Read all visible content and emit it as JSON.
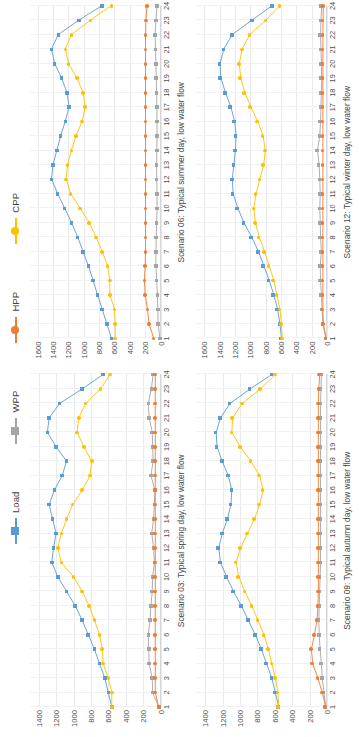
{
  "figure": {
    "legend": [
      {
        "name": "Load",
        "color": "#5b9bd5",
        "marker": "square"
      },
      {
        "name": "WPP",
        "color": "#a5a5a5",
        "marker": "square"
      },
      {
        "name": "HPP",
        "color": "#ed7d31",
        "marker": "circle"
      },
      {
        "name": "CPP",
        "color": "#ffc000",
        "marker": "circle"
      }
    ]
  },
  "chart_data": [
    {
      "type": "line",
      "title": "Scenario 03: Typical spring day, low water flow",
      "xlabel": "",
      "ylabel": "",
      "grid": true,
      "legend_position": "top",
      "x": [
        1,
        2,
        3,
        4,
        5,
        6,
        7,
        8,
        9,
        10,
        11,
        12,
        13,
        14,
        15,
        16,
        17,
        18,
        19,
        20,
        21,
        22,
        23,
        24
      ],
      "xtick_labels": [
        "1",
        "2",
        "3",
        "4",
        "5",
        "6",
        "7",
        "8",
        "9",
        "10",
        "11",
        "12",
        "13",
        "14",
        "15",
        "16",
        "17",
        "18",
        "19",
        "20",
        "21",
        "22",
        "23",
        "24"
      ],
      "ylim": [
        0,
        1500
      ],
      "ytick_labels": [
        "0",
        "200",
        "400",
        "600",
        "800",
        "1000",
        "1200",
        "1400"
      ],
      "yticks": [
        0,
        200,
        400,
        600,
        800,
        1000,
        1200,
        1400
      ],
      "series": [
        {
          "name": "Load",
          "color": "#5b9bd5",
          "values": [
            560,
            600,
            640,
            700,
            760,
            830,
            900,
            980,
            1080,
            1180,
            1250,
            1230,
            1200,
            1240,
            1280,
            1220,
            1130,
            1080,
            1200,
            1300,
            1280,
            1160,
            900,
            660
          ]
        },
        {
          "name": "CPP",
          "color": "#ffc000",
          "values": [
            560,
            560,
            600,
            660,
            670,
            700,
            760,
            820,
            900,
            1000,
            1140,
            1180,
            1140,
            1080,
            1010,
            900,
            810,
            790,
            880,
            960,
            940,
            860,
            690,
            580
          ]
        },
        {
          "name": "WPP",
          "color": "#a5a5a5",
          "values": [
            20,
            90,
            95,
            130,
            135,
            140,
            120,
            110,
            95,
            90,
            70,
            80,
            100,
            80,
            70,
            65,
            110,
            85,
            90,
            95,
            130,
            140,
            105,
            85
          ]
        },
        {
          "name": "HPP",
          "color": "#ed7d31",
          "values": [
            20,
            60,
            60,
            60,
            60,
            60,
            60,
            60,
            60,
            60,
            60,
            60,
            60,
            60,
            60,
            60,
            60,
            60,
            60,
            60,
            60,
            60,
            60,
            60
          ]
        }
      ]
    },
    {
      "type": "line",
      "title": "Scenario 06: Typical summer day, low water flow",
      "xlabel": "",
      "ylabel": "",
      "grid": true,
      "legend_position": "top",
      "x": [
        1,
        2,
        3,
        4,
        5,
        6,
        7,
        8,
        9,
        10,
        11,
        12,
        13,
        14,
        15,
        16,
        17,
        18,
        19,
        20,
        21,
        22,
        23,
        24
      ],
      "xtick_labels": [
        "1",
        "2",
        "3",
        "4",
        "5",
        "6",
        "7",
        "8",
        "9",
        "10",
        "11",
        "12",
        "13",
        "14",
        "15",
        "16",
        "17",
        "18",
        "19",
        "20",
        "21",
        "22",
        "23",
        "24"
      ],
      "ylim": [
        0,
        1700
      ],
      "ytick_labels": [
        "0",
        "200",
        "400",
        "600",
        "800",
        "1000",
        "1200",
        "1400",
        "1600"
      ],
      "yticks": [
        0,
        200,
        400,
        600,
        800,
        1000,
        1200,
        1400,
        1600
      ],
      "series": [
        {
          "name": "Load",
          "color": "#5b9bd5",
          "values": [
            640,
            700,
            760,
            820,
            880,
            940,
            1010,
            1080,
            1160,
            1250,
            1340,
            1420,
            1400,
            1350,
            1300,
            1240,
            1190,
            1220,
            1290,
            1380,
            1420,
            1330,
            1060,
            760
          ]
        },
        {
          "name": "CPP",
          "color": "#ffc000",
          "values": [
            590,
            590,
            600,
            660,
            660,
            690,
            760,
            840,
            930,
            1050,
            1170,
            1230,
            1210,
            1160,
            1100,
            1020,
            980,
            1010,
            1090,
            1200,
            1240,
            1160,
            910,
            640
          ]
        },
        {
          "name": "WPP",
          "color": "#a5a5a5",
          "values": [
            10,
            30,
            35,
            40,
            50,
            60,
            60,
            55,
            50,
            45,
            45,
            50,
            50,
            48,
            45,
            45,
            48,
            50,
            55,
            60,
            65,
            70,
            60,
            45
          ]
        },
        {
          "name": "HPP",
          "color": "#ed7d31",
          "values": [
            90,
            150,
            170,
            200,
            210,
            200,
            195,
            195,
            195,
            195,
            195,
            195,
            195,
            195,
            195,
            195,
            195,
            195,
            195,
            195,
            195,
            195,
            190,
            175
          ]
        }
      ]
    },
    {
      "type": "line",
      "title": "Scenario 09: Typical autumn day, low water flow",
      "xlabel": "",
      "ylabel": "",
      "grid": true,
      "legend_position": "top",
      "x": [
        1,
        2,
        3,
        4,
        5,
        6,
        7,
        8,
        9,
        10,
        11,
        12,
        13,
        14,
        15,
        16,
        17,
        18,
        19,
        20,
        21,
        22,
        23,
        24
      ],
      "xtick_labels": [
        "1",
        "2",
        "3",
        "4",
        "5",
        "6",
        "7",
        "8",
        "9",
        "10",
        "11",
        "12",
        "13",
        "14",
        "15",
        "16",
        "17",
        "18",
        "19",
        "20",
        "21",
        "22",
        "23",
        "24"
      ],
      "ylim": [
        0,
        1500
      ],
      "ytick_labels": [
        "0",
        "200",
        "400",
        "600",
        "800",
        "1000",
        "1200",
        "1400"
      ],
      "yticks": [
        0,
        200,
        400,
        600,
        800,
        1000,
        1200,
        1400
      ],
      "series": [
        {
          "name": "Load",
          "color": "#5b9bd5",
          "values": [
            560,
            600,
            640,
            700,
            760,
            830,
            910,
            990,
            1080,
            1160,
            1230,
            1250,
            1210,
            1150,
            1110,
            1100,
            1140,
            1210,
            1270,
            1280,
            1230,
            1120,
            890,
            640
          ]
        },
        {
          "name": "CPP",
          "color": "#ffc000",
          "values": [
            560,
            570,
            600,
            640,
            680,
            730,
            800,
            870,
            950,
            1020,
            1050,
            1000,
            920,
            840,
            780,
            740,
            780,
            880,
            1000,
            1100,
            1090,
            980,
            770,
            600
          ]
        },
        {
          "name": "WPP",
          "color": "#a5a5a5",
          "values": [
            20,
            40,
            60,
            70,
            85,
            95,
            100,
            95,
            90,
            85,
            80,
            80,
            80,
            80,
            80,
            80,
            80,
            80,
            80,
            80,
            80,
            80,
            75,
            70
          ]
        },
        {
          "name": "HPP",
          "color": "#ed7d31",
          "values": [
            20,
            60,
            110,
            170,
            185,
            150,
            120,
            110,
            105,
            105,
            105,
            105,
            105,
            105,
            105,
            105,
            105,
            105,
            105,
            105,
            105,
            105,
            100,
            90
          ]
        }
      ]
    },
    {
      "type": "line",
      "title": "Scenario 12: Typical winter day, low water flow",
      "xlabel": "",
      "ylabel": "",
      "grid": true,
      "legend_position": "top",
      "x": [
        1,
        2,
        3,
        4,
        5,
        6,
        7,
        8,
        9,
        10,
        11,
        12,
        13,
        14,
        15,
        16,
        17,
        18,
        19,
        20,
        21,
        22,
        23,
        24
      ],
      "xtick_labels": [
        "1",
        "2",
        "3",
        "4",
        "5",
        "6",
        "7",
        "8",
        "9",
        "10",
        "11",
        "12",
        "13",
        "14",
        "15",
        "16",
        "17",
        "18",
        "19",
        "20",
        "21",
        "22",
        "23",
        "24"
      ],
      "ylim": [
        0,
        1700
      ],
      "ytick_labels": [
        "0",
        "200",
        "400",
        "600",
        "800",
        "1000",
        "1200",
        "1400",
        "1600"
      ],
      "yticks": [
        0,
        200,
        400,
        600,
        800,
        1000,
        1200,
        1400,
        1600
      ],
      "series": [
        {
          "name": "Load",
          "color": "#5b9bd5",
          "values": [
            600,
            620,
            650,
            700,
            760,
            830,
            900,
            990,
            1090,
            1170,
            1230,
            1240,
            1220,
            1200,
            1190,
            1210,
            1260,
            1330,
            1390,
            1400,
            1350,
            1240,
            980,
            720
          ]
        },
        {
          "name": "CPP",
          "color": "#ffc000",
          "values": [
            590,
            600,
            620,
            660,
            700,
            760,
            820,
            890,
            940,
            960,
            930,
            880,
            830,
            810,
            840,
            910,
            1000,
            1080,
            1130,
            1150,
            1110,
            1010,
            800,
            620
          ]
        },
        {
          "name": "WPP",
          "color": "#a5a5a5",
          "values": [
            20,
            60,
            70,
            80,
            90,
            95,
            80,
            90,
            95,
            100,
            95,
            100,
            110,
            130,
            100,
            90,
            85,
            80,
            75,
            80,
            85,
            90,
            85,
            75
          ]
        },
        {
          "name": "HPP",
          "color": "#ed7d31",
          "values": [
            20,
            55,
            60,
            60,
            60,
            60,
            60,
            60,
            60,
            60,
            60,
            60,
            60,
            60,
            60,
            60,
            60,
            60,
            60,
            60,
            60,
            60,
            58,
            55
          ]
        }
      ]
    }
  ]
}
